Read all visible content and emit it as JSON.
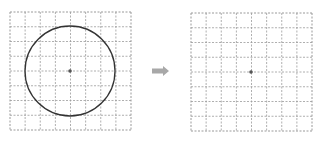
{
  "diagram": {
    "left_panel": {
      "grid": {
        "x": 10,
        "y": 12,
        "width": 121,
        "height": 118,
        "cols": 8,
        "rows": 8
      },
      "circle": {
        "cx": 70,
        "cy": 71,
        "r": 45
      },
      "center_point": {
        "cx": 70,
        "cy": 71
      }
    },
    "arrow": {
      "x1": 152,
      "x2": 169,
      "y": 71
    },
    "right_panel": {
      "grid": {
        "x": 191,
        "y": 13,
        "width": 121,
        "height": 118,
        "cols": 8,
        "rows": 8
      },
      "center_point": {
        "cx": 251,
        "cy": 72
      }
    },
    "colors": {
      "grid": "#9a9a9a",
      "circle": "#333333",
      "point": "#555555",
      "arrow": "#a8a8a8"
    }
  }
}
